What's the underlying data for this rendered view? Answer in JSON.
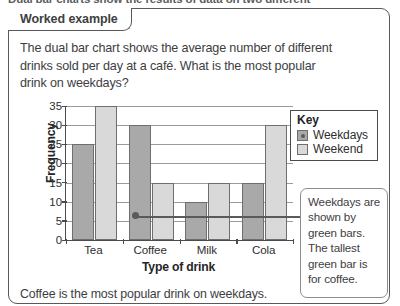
{
  "page": {
    "cut_off_heading": "Dual bar charts show the results of data on two different",
    "card_tab_label": "Worked example",
    "question": "The dual bar chart shows the average number of different drinks sold per day at a café. What is the most popular drink on weekdays?",
    "answer": "Coffee is the most popular drink on weekdays.",
    "callout_text": "Weekdays are shown by green bars. The tallest green bar is for coffee."
  },
  "legend": {
    "title": "Key",
    "items": [
      {
        "label": "Weekdays",
        "color": "#a9a9a9"
      },
      {
        "label": "Weekend",
        "color": "#d9d9d9"
      }
    ]
  },
  "chart_data": {
    "type": "bar",
    "title": "",
    "categories": [
      "Tea",
      "Coffee",
      "Milk",
      "Cola"
    ],
    "series": [
      {
        "name": "Weekdays",
        "values": [
          25,
          30,
          10,
          15
        ],
        "color": "#a9a9a9"
      },
      {
        "name": "Weekend",
        "values": [
          35,
          15,
          15,
          30
        ],
        "color": "#d9d9d9"
      }
    ],
    "xlabel": "Type of drink",
    "ylabel": "Frequency",
    "ylim": [
      0,
      35
    ],
    "ytick_step": 5,
    "yticks": [
      0,
      5,
      10,
      15,
      20,
      25,
      30,
      35
    ],
    "grid": true,
    "legend_position": "top-right",
    "annotation": {
      "target_series": "Weekdays",
      "target_category": "Coffee",
      "text": "Weekdays are shown by green bars. The tallest green bar is for coffee."
    }
  }
}
